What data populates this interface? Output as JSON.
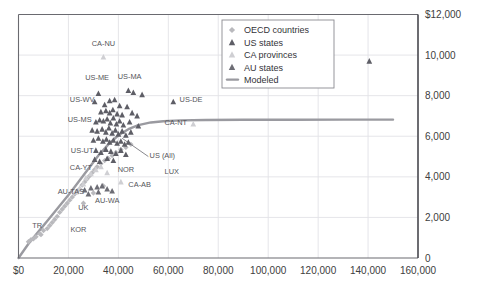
{
  "chart_data": {
    "type": "scatter",
    "title": "",
    "xlabel": "",
    "ylabel": "",
    "xlim": [
      0,
      160000
    ],
    "ylim": [
      0,
      12000
    ],
    "grid": true,
    "legend_position": "top-right",
    "x_ticks": [
      "$0",
      "20,000",
      "40,000",
      "60,000",
      "80,000",
      "100,000",
      "120,000",
      "140,000",
      "160,000"
    ],
    "x_tick_values": [
      0,
      20000,
      40000,
      60000,
      80000,
      100000,
      120000,
      140000,
      160000
    ],
    "y_ticks": [
      "0",
      "2,000",
      "4,000",
      "6,000",
      "8,000",
      "10,000",
      "$12,000"
    ],
    "y_tick_values": [
      0,
      2000,
      4000,
      6000,
      8000,
      10000,
      12000
    ],
    "y_axis_side": "right",
    "legend": [
      {
        "label": "OECD countries",
        "marker": "diamond",
        "color": "#b9b9bd"
      },
      {
        "label": "US states",
        "marker": "triangle",
        "color": "#5e5e66"
      },
      {
        "label": "CA provinces",
        "marker": "triangle",
        "color": "#cfcfd3"
      },
      {
        "label": "AU states",
        "marker": "triangle",
        "color": "#6d6d75"
      },
      {
        "label": "Modeled",
        "marker": "line",
        "color": "#9a9aa0"
      }
    ],
    "series": [
      {
        "name": "OECD countries",
        "marker": "diamond",
        "color": "#b9b9bd",
        "points": [
          {
            "x": 5000,
            "y": 900
          },
          {
            "x": 7000,
            "y": 1050
          },
          {
            "x": 8500,
            "y": 1200
          },
          {
            "x": 10000,
            "y": 1350
          },
          {
            "x": 11500,
            "y": 1450
          },
          {
            "x": 12500,
            "y": 1600
          },
          {
            "x": 13500,
            "y": 1750
          },
          {
            "x": 14500,
            "y": 1900
          },
          {
            "x": 15500,
            "y": 2050
          },
          {
            "x": 16500,
            "y": 2250
          },
          {
            "x": 17500,
            "y": 2400
          },
          {
            "x": 18500,
            "y": 2550
          },
          {
            "x": 19500,
            "y": 2700
          },
          {
            "x": 20500,
            "y": 2850
          },
          {
            "x": 21500,
            "y": 3000
          },
          {
            "x": 22500,
            "y": 3150
          },
          {
            "x": 23500,
            "y": 3300
          },
          {
            "x": 24500,
            "y": 3400
          },
          {
            "x": 25500,
            "y": 3600
          },
          {
            "x": 26500,
            "y": 3750
          },
          {
            "x": 27500,
            "y": 3900
          },
          {
            "x": 28500,
            "y": 4050
          },
          {
            "x": 29500,
            "y": 4200
          },
          {
            "x": 30500,
            "y": 4350
          },
          {
            "x": 31500,
            "y": 4500
          },
          {
            "x": 33000,
            "y": 4650
          },
          {
            "x": 34500,
            "y": 4800
          },
          {
            "x": 36000,
            "y": 4900
          },
          {
            "x": 37500,
            "y": 5050
          },
          {
            "x": 39000,
            "y": 5200
          },
          {
            "x": 41000,
            "y": 5350
          },
          {
            "x": 43000,
            "y": 5450
          },
          {
            "x": 45000,
            "y": 5600
          },
          {
            "x": 34000,
            "y": 3550
          },
          {
            "x": 30000,
            "y": 3200
          },
          {
            "x": 26000,
            "y": 2700
          },
          {
            "x": 4000,
            "y": 800
          },
          {
            "x": 6000,
            "y": 950
          },
          {
            "x": 9000,
            "y": 1150
          }
        ]
      },
      {
        "name": "US states",
        "marker": "triangle",
        "color": "#5e5e66",
        "points": [
          {
            "x": 32000,
            "y": 8100
          },
          {
            "x": 44000,
            "y": 8250
          },
          {
            "x": 46000,
            "y": 8150
          },
          {
            "x": 49500,
            "y": 8050
          },
          {
            "x": 30500,
            "y": 7700
          },
          {
            "x": 36500,
            "y": 7750
          },
          {
            "x": 38500,
            "y": 7800
          },
          {
            "x": 34500,
            "y": 7550
          },
          {
            "x": 40500,
            "y": 7500
          },
          {
            "x": 43500,
            "y": 7450
          },
          {
            "x": 62000,
            "y": 7700
          },
          {
            "x": 33000,
            "y": 7200
          },
          {
            "x": 35000,
            "y": 7250
          },
          {
            "x": 36500,
            "y": 7150
          },
          {
            "x": 37800,
            "y": 7300
          },
          {
            "x": 39500,
            "y": 7100
          },
          {
            "x": 41500,
            "y": 7050
          },
          {
            "x": 45500,
            "y": 7150
          },
          {
            "x": 47500,
            "y": 7000
          },
          {
            "x": 31000,
            "y": 6700
          },
          {
            "x": 32500,
            "y": 6800
          },
          {
            "x": 34000,
            "y": 6750
          },
          {
            "x": 35500,
            "y": 6850
          },
          {
            "x": 36800,
            "y": 6650
          },
          {
            "x": 38000,
            "y": 6900
          },
          {
            "x": 39200,
            "y": 6600
          },
          {
            "x": 40500,
            "y": 6750
          },
          {
            "x": 42000,
            "y": 6550
          },
          {
            "x": 44500,
            "y": 6700
          },
          {
            "x": 48000,
            "y": 6500
          },
          {
            "x": 29500,
            "y": 6300
          },
          {
            "x": 31500,
            "y": 6250
          },
          {
            "x": 33500,
            "y": 6350
          },
          {
            "x": 35000,
            "y": 6200
          },
          {
            "x": 36200,
            "y": 6400
          },
          {
            "x": 37500,
            "y": 6150
          },
          {
            "x": 38800,
            "y": 6300
          },
          {
            "x": 40000,
            "y": 6100
          },
          {
            "x": 41500,
            "y": 6250
          },
          {
            "x": 43000,
            "y": 6050
          },
          {
            "x": 45000,
            "y": 6200
          },
          {
            "x": 30000,
            "y": 5800
          },
          {
            "x": 32000,
            "y": 5900
          },
          {
            "x": 33800,
            "y": 5750
          },
          {
            "x": 35200,
            "y": 5850
          },
          {
            "x": 36500,
            "y": 5700
          },
          {
            "x": 38000,
            "y": 5800
          },
          {
            "x": 39500,
            "y": 5650
          },
          {
            "x": 41000,
            "y": 5750
          },
          {
            "x": 42500,
            "y": 5600
          },
          {
            "x": 44000,
            "y": 5700
          },
          {
            "x": 31000,
            "y": 5300
          },
          {
            "x": 33000,
            "y": 5200
          },
          {
            "x": 35000,
            "y": 5350
          },
          {
            "x": 37000,
            "y": 5250
          },
          {
            "x": 39000,
            "y": 5150
          },
          {
            "x": 41000,
            "y": 5300
          },
          {
            "x": 43000,
            "y": 5100
          },
          {
            "x": 30500,
            "y": 4850
          },
          {
            "x": 32500,
            "y": 4750
          },
          {
            "x": 35500,
            "y": 4900
          },
          {
            "x": 38000,
            "y": 4800
          },
          {
            "x": 140500,
            "y": 9700
          }
        ]
      },
      {
        "name": "CA provinces",
        "marker": "triangle",
        "color": "#cfcfd3",
        "points": [
          {
            "x": 34000,
            "y": 9900
          },
          {
            "x": 70000,
            "y": 6600
          },
          {
            "x": 41000,
            "y": 3750
          },
          {
            "x": 29000,
            "y": 4150
          },
          {
            "x": 31000,
            "y": 4350
          },
          {
            "x": 27000,
            "y": 3950
          },
          {
            "x": 26000,
            "y": 3650
          },
          {
            "x": 24500,
            "y": 3450
          },
          {
            "x": 23000,
            "y": 3250
          },
          {
            "x": 33000,
            "y": 4500
          },
          {
            "x": 35500,
            "y": 4200
          }
        ]
      },
      {
        "name": "AU states",
        "marker": "triangle",
        "color": "#6d6d75",
        "points": [
          {
            "x": 26500,
            "y": 3350
          },
          {
            "x": 29000,
            "y": 3450
          },
          {
            "x": 31500,
            "y": 3500
          },
          {
            "x": 33500,
            "y": 3550
          },
          {
            "x": 35500,
            "y": 3400
          },
          {
            "x": 37500,
            "y": 3300
          },
          {
            "x": 28000,
            "y": 3150
          },
          {
            "x": 32000,
            "y": 3250
          }
        ]
      }
    ],
    "modeled_curve": {
      "name": "Modeled",
      "color": "#9a9aa0",
      "plateau": 6800,
      "points": [
        {
          "x": 0,
          "y": 0
        },
        {
          "x": 4000,
          "y": 700
        },
        {
          "x": 8000,
          "y": 1300
        },
        {
          "x": 12000,
          "y": 1900
        },
        {
          "x": 16000,
          "y": 2500
        },
        {
          "x": 20000,
          "y": 3100
        },
        {
          "x": 24000,
          "y": 3750
        },
        {
          "x": 28000,
          "y": 4400
        },
        {
          "x": 32000,
          "y": 5050
        },
        {
          "x": 36000,
          "y": 5600
        },
        {
          "x": 40000,
          "y": 6050
        },
        {
          "x": 44000,
          "y": 6350
        },
        {
          "x": 48000,
          "y": 6550
        },
        {
          "x": 53000,
          "y": 6680
        },
        {
          "x": 58000,
          "y": 6740
        },
        {
          "x": 65000,
          "y": 6780
        },
        {
          "x": 75000,
          "y": 6800
        },
        {
          "x": 90000,
          "y": 6810
        },
        {
          "x": 110000,
          "y": 6815
        },
        {
          "x": 130000,
          "y": 6818
        },
        {
          "x": 150000,
          "y": 6820
        }
      ]
    },
    "annotations": [
      {
        "text": "CA-NU",
        "x": 34000,
        "y": 10450,
        "anchor": "middle"
      },
      {
        "text": "US-ME",
        "x": 31500,
        "y": 8750,
        "anchor": "middle"
      },
      {
        "text": "US-MA",
        "x": 44500,
        "y": 8800,
        "anchor": "middle"
      },
      {
        "text": "US-WV",
        "x": 25500,
        "y": 7700,
        "anchor": "middle"
      },
      {
        "text": "US-DE",
        "x": 64500,
        "y": 7700,
        "anchor": "start"
      },
      {
        "text": "US-MS",
        "x": 24500,
        "y": 6700,
        "anchor": "middle"
      },
      {
        "text": "CA-NT",
        "x": 67500,
        "y": 6550,
        "anchor": "end"
      },
      {
        "text": "US-UT",
        "x": 25500,
        "y": 5150,
        "anchor": "middle"
      },
      {
        "text": "US (All)",
        "x": 52500,
        "y": 4950,
        "anchor": "start"
      },
      {
        "text": "CA-YT",
        "x": 25000,
        "y": 4350,
        "anchor": "middle"
      },
      {
        "text": "NOR",
        "x": 43000,
        "y": 4250,
        "anchor": "middle"
      },
      {
        "text": "LUX",
        "x": 58500,
        "y": 4150,
        "anchor": "start"
      },
      {
        "text": "CA-AB",
        "x": 44000,
        "y": 3500,
        "anchor": "start"
      },
      {
        "text": "AU-TAS",
        "x": 21000,
        "y": 3150,
        "anchor": "middle"
      },
      {
        "text": "AU-WA",
        "x": 35500,
        "y": 2700,
        "anchor": "middle"
      },
      {
        "text": "UK",
        "x": 26000,
        "y": 2350,
        "anchor": "middle"
      },
      {
        "text": "TR",
        "x": 7500,
        "y": 1500,
        "anchor": "middle"
      },
      {
        "text": "KOR",
        "x": 24000,
        "y": 1300,
        "anchor": "middle"
      }
    ],
    "leader_line": {
      "from_x": 52000,
      "from_y": 5000,
      "to_x": 41500,
      "to_y": 5900
    }
  }
}
